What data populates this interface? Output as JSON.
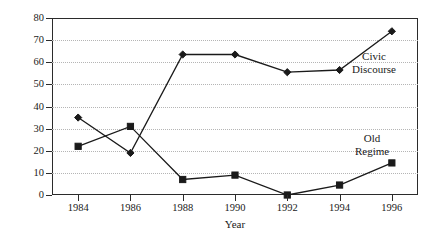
{
  "chart_data": {
    "type": "line",
    "title": "",
    "xlabel": "Year",
    "ylabel": "Percentage of Coverage",
    "x": [
      1984,
      1986,
      1988,
      1990,
      1992,
      1994,
      1996
    ],
    "xtick_labels": [
      "1984",
      "1986",
      "1988",
      "1990",
      "1992",
      "1994",
      "1996"
    ],
    "ytick_labels": [
      "0",
      "10",
      "20",
      "30",
      "40",
      "50",
      "60",
      "70",
      "80"
    ],
    "ytick_values": [
      0,
      10,
      20,
      30,
      40,
      50,
      60,
      70,
      80
    ],
    "xlim": [
      1983,
      1997
    ],
    "ylim": [
      0,
      80
    ],
    "grid": "horizontal-dotted",
    "legend_position": "inline-annotations",
    "series": [
      {
        "name": "Civic Discourse",
        "marker": "diamond",
        "values": [
          35,
          19,
          63.5,
          63.5,
          55.5,
          56.5,
          74
        ]
      },
      {
        "name": "Old Regime",
        "marker": "square",
        "values": [
          22,
          31,
          7,
          9,
          0,
          4.5,
          14.5
        ]
      }
    ],
    "annotations": [
      {
        "text_line1": "Civic",
        "text_line2": "Discourse"
      },
      {
        "text_line1": "Old",
        "text_line2": "Regime"
      }
    ]
  },
  "colors": {
    "line": "#1a1a1a",
    "grid": "#b5b5b5",
    "frame": "#2b2b2b",
    "background": "#ffffff"
  }
}
